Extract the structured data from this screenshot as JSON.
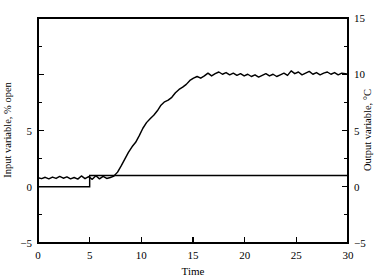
{
  "chart_data": {
    "type": "line",
    "title": "",
    "subtitle": "",
    "xlabel": "Time",
    "ylabel": "Input variable, % open",
    "y2label": "Output variable, °C",
    "xlim": [
      0,
      30
    ],
    "ylim": [
      -5,
      15
    ],
    "y2lim": [
      -5,
      15
    ],
    "grid": false,
    "legend": "none",
    "x_ticks": [
      0,
      5,
      10,
      15,
      20,
      25,
      30
    ],
    "x_tick_labels": [
      "0",
      "5",
      "10",
      "15",
      "20",
      "25",
      "30"
    ],
    "y_ticks": [
      -5,
      0,
      5,
      10,
      15
    ],
    "y_tick_labels": [
      "-5",
      "0",
      "5",
      "",
      ""
    ],
    "y_minor_ticks": [
      -2.5,
      2.5,
      7.5,
      12.5
    ],
    "y2_ticks": [
      -5,
      0,
      5,
      10,
      15
    ],
    "y2_tick_labels": [
      "-5",
      "0",
      "5",
      "10",
      "15"
    ],
    "y2_minor_ticks": [
      -2.5,
      2.5,
      7.5,
      12.5
    ],
    "series": [
      {
        "name": "Output variable",
        "axis": "right",
        "style": "noisy-line",
        "x": [
          0.0,
          0.35,
          0.7,
          1.05,
          1.4,
          1.75,
          2.1,
          2.45,
          2.8,
          3.15,
          3.5,
          3.85,
          4.2,
          4.55,
          4.9,
          5.25,
          5.6,
          5.95,
          6.3,
          6.65,
          7.0,
          7.35,
          7.7,
          8.05,
          8.4,
          8.75,
          9.1,
          9.45,
          9.8,
          10.15,
          10.5,
          10.85,
          11.2,
          11.55,
          11.9,
          12.25,
          12.6,
          12.95,
          13.3,
          13.65,
          14.0,
          14.35,
          14.7,
          15.05,
          15.4,
          15.75,
          16.1,
          16.45,
          16.8,
          17.15,
          17.5,
          17.85,
          18.2,
          18.55,
          18.9,
          19.25,
          19.6,
          19.95,
          20.3,
          20.65,
          21.0,
          21.35,
          21.7,
          22.05,
          22.4,
          22.75,
          23.1,
          23.45,
          23.8,
          24.15,
          24.5,
          24.85,
          25.2,
          25.55,
          25.9,
          26.25,
          26.6,
          26.95,
          27.3,
          27.65,
          28.0,
          28.35,
          28.7,
          29.05,
          29.4,
          29.75,
          30.0
        ],
        "y": [
          0.8,
          0.72,
          0.84,
          0.7,
          0.86,
          0.74,
          0.92,
          0.76,
          0.88,
          0.7,
          0.82,
          0.68,
          0.96,
          0.72,
          0.9,
          0.66,
          0.98,
          0.7,
          0.92,
          0.74,
          0.82,
          0.95,
          1.3,
          1.85,
          2.45,
          3.05,
          3.55,
          3.95,
          4.55,
          5.2,
          5.7,
          6.05,
          6.35,
          6.75,
          7.25,
          7.55,
          7.7,
          7.95,
          8.35,
          8.65,
          8.85,
          9.1,
          9.45,
          9.65,
          9.8,
          9.65,
          9.85,
          10.1,
          9.85,
          10.05,
          10.2,
          10.0,
          10.15,
          9.95,
          10.1,
          9.9,
          10.05,
          9.85,
          10.0,
          9.8,
          9.95,
          9.75,
          9.9,
          10.05,
          9.85,
          10.0,
          9.8,
          9.95,
          10.1,
          9.9,
          10.3,
          10.05,
          10.2,
          9.95,
          10.1,
          10.25,
          10.0,
          10.15,
          9.95,
          10.1,
          10.2,
          10.0,
          10.15,
          9.95,
          10.1,
          10.05,
          10.0
        ]
      },
      {
        "name": "Input variable",
        "axis": "left",
        "style": "step",
        "step_time": 5,
        "level_before": 0.0,
        "level_after": 1.0,
        "x": [
          0,
          5,
          5,
          30
        ],
        "y": [
          0.0,
          0.0,
          1.0,
          1.0
        ]
      }
    ],
    "annotations": []
  },
  "figure": {
    "background_color": "#ffffff",
    "line_color": "#000000",
    "frame_color": "#000000"
  }
}
